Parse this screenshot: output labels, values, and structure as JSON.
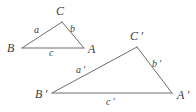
{
  "figure": {
    "stroke_color": "#6e6e6e",
    "label_color": "#3b3b3b",
    "background_color": "#ffffff",
    "stroke_width": 1
  },
  "triangles": [
    {
      "id": "small",
      "name": "triangle-abc",
      "vertices": [
        {
          "label": "C",
          "x": 62,
          "y": 22
        },
        {
          "label": "B",
          "x": 22,
          "y": 48
        },
        {
          "label": "A",
          "x": 84,
          "y": 48
        }
      ],
      "sides": [
        {
          "label": "a",
          "from": "B",
          "to": "C"
        },
        {
          "label": "b",
          "from": "C",
          "to": "A"
        },
        {
          "label": "c",
          "from": "B",
          "to": "A"
        }
      ]
    },
    {
      "id": "large",
      "name": "triangle-a-prime-b-prime-c-prime",
      "vertices": [
        {
          "label": "C'",
          "x": 137,
          "y": 47
        },
        {
          "label": "B'",
          "x": 52,
          "y": 93
        },
        {
          "label": "A'",
          "x": 172,
          "y": 93
        }
      ],
      "sides": [
        {
          "label": "a'",
          "from": "B'",
          "to": "C'"
        },
        {
          "label": "b'",
          "from": "C'",
          "to": "A'"
        },
        {
          "label": "c'",
          "from": "B'",
          "to": "A'"
        }
      ]
    }
  ],
  "labels": {
    "C": "C",
    "B": "B",
    "A": "A",
    "a": "a",
    "b": "b",
    "c": "c",
    "Cp": "C ′",
    "Bp": "B ′",
    "Ap": "A ′",
    "ap": "a ′",
    "bp": "b ′",
    "cp": "c ′"
  }
}
